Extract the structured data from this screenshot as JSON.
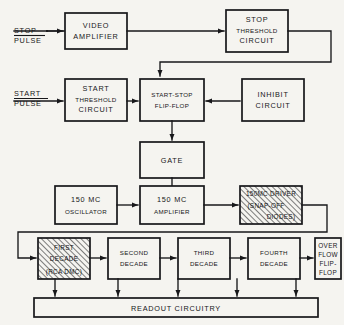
{
  "diagram": {
    "background_color": "#f5f4f0",
    "line_color": "#17171a",
    "inputs": [
      {
        "id": "stop-pulse",
        "line1": "STOP",
        "line2": "PULSE"
      },
      {
        "id": "start-pulse",
        "line1": "START",
        "line2": "PULSE"
      }
    ],
    "blocks": [
      {
        "id": "video-amplifier",
        "lines": [
          "VIDEO",
          "AMPLIFIER"
        ],
        "hatched": false
      },
      {
        "id": "stop-threshold-circuit",
        "lines": [
          "STOP",
          "THRESHOLD",
          "CIRCUIT"
        ],
        "hatched": false
      },
      {
        "id": "start-threshold-circuit",
        "lines": [
          "START",
          "THRESHOLD",
          "CIRCUIT"
        ],
        "hatched": false
      },
      {
        "id": "start-stop-flip-flop",
        "lines": [
          "START-STOP",
          "FLIP-FLOP"
        ],
        "hatched": false
      },
      {
        "id": "inhibit-circuit",
        "lines": [
          "INHIBIT",
          "CIRCUIT"
        ],
        "hatched": false
      },
      {
        "id": "gate",
        "lines": [
          "GATE"
        ],
        "hatched": false
      },
      {
        "id": "oscillator-150mc",
        "lines": [
          "150 MC",
          "OSCILLATOR"
        ],
        "hatched": false
      },
      {
        "id": "amplifier-150mc",
        "lines": [
          "150 MC",
          "AMPLIFIER"
        ],
        "hatched": false
      },
      {
        "id": "driver-150mc",
        "lines": [
          "150MC DRIVER",
          "(SNAP-OFF",
          "DIODES)"
        ],
        "hatched": true
      },
      {
        "id": "first-decade",
        "lines": [
          "FIRST",
          "DECADE",
          "(RCA DMC)"
        ],
        "hatched": true
      },
      {
        "id": "second-decade",
        "lines": [
          "SECOND",
          "DECADE"
        ],
        "hatched": false
      },
      {
        "id": "third-decade",
        "lines": [
          "THIRD",
          "DECADE"
        ],
        "hatched": false
      },
      {
        "id": "fourth-decade",
        "lines": [
          "FOURTH",
          "DECADE"
        ],
        "hatched": false
      },
      {
        "id": "overflow-flip-flop",
        "lines": [
          "OVER",
          "FLOW",
          "FLIP-",
          "FLOP"
        ],
        "hatched": false
      },
      {
        "id": "readout-circuitry",
        "lines": [
          "READOUT CIRCUITRY"
        ],
        "hatched": false
      }
    ]
  },
  "labels": {
    "stop_pulse_1": "STOP",
    "stop_pulse_2": "PULSE",
    "start_pulse_1": "START",
    "start_pulse_2": "PULSE",
    "video_amplifier_1": "VIDEO",
    "video_amplifier_2": "AMPLIFIER",
    "stop_threshold_1": "STOP",
    "stop_threshold_2": "THRESHOLD",
    "stop_threshold_3": "CIRCUIT",
    "start_threshold_1": "START",
    "start_threshold_2": "THRESHOLD",
    "start_threshold_3": "CIRCUIT",
    "start_stop_ff_1": "START-STOP",
    "start_stop_ff_2": "FLIP-FLOP",
    "inhibit_1": "INHIBIT",
    "inhibit_2": "CIRCUIT",
    "gate_1": "GATE",
    "oscillator_1": "150 MC",
    "oscillator_2": "OSCILLATOR",
    "amplifier_1": "150 MC",
    "amplifier_2": "AMPLIFIER",
    "driver_1": "150MC DRIVER",
    "driver_2": "(SNAP-OFF",
    "driver_3": "DIODES)",
    "first_decade_1": "FIRST",
    "first_decade_2": "DECADE",
    "first_decade_3": "(RCA DMC)",
    "second_decade_1": "SECOND",
    "second_decade_2": "DECADE",
    "third_decade_1": "THIRD",
    "third_decade_2": "DECADE",
    "fourth_decade_1": "FOURTH",
    "fourth_decade_2": "DECADE",
    "overflow_1": "OVER",
    "overflow_2": "FLOW",
    "overflow_3": "FLIP-",
    "overflow_4": "FLOP",
    "readout_1": "READOUT CIRCUITRY"
  }
}
